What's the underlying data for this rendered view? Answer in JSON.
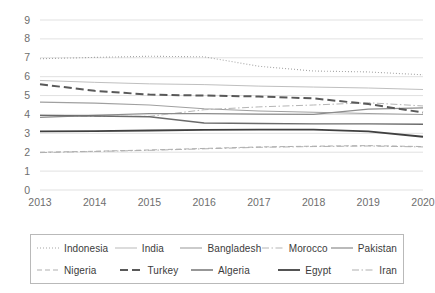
{
  "chart_data": {
    "type": "line",
    "title": "",
    "xlabel": "",
    "ylabel": "",
    "categories": [
      "2013",
      "2014",
      "2015",
      "2016",
      "2017",
      "2018",
      "2019",
      "2020"
    ],
    "x": [
      2013,
      2014,
      2015,
      2016,
      2017,
      2018,
      2019,
      2020
    ],
    "ylim": [
      0,
      9
    ],
    "yticks": [
      "0",
      "1",
      "2",
      "3",
      "4",
      "5",
      "6",
      "7",
      "8",
      "9"
    ],
    "grid": "horizontal",
    "legend_position": "bottom",
    "series": [
      {
        "name": "Indonesia",
        "style": "dotted",
        "color": "#a6a6a6",
        "width": 1.1,
        "values": [
          6.95,
          7.02,
          7.08,
          7.05,
          6.55,
          6.3,
          6.25,
          6.1
        ]
      },
      {
        "name": "India",
        "style": "solid",
        "color": "#bfbfbf",
        "width": 1.0,
        "values": [
          5.8,
          5.7,
          5.62,
          5.58,
          5.5,
          5.45,
          5.4,
          5.32
        ]
      },
      {
        "name": "Bangladesh",
        "style": "solid",
        "color": "#a0a0a0",
        "width": 1.1,
        "values": [
          4.65,
          4.6,
          4.5,
          4.3,
          4.18,
          4.12,
          4.05,
          4.0
        ]
      },
      {
        "name": "Morocco",
        "style": "dashdot",
        "color": "#b5b5b5",
        "width": 1.0,
        "values": [
          3.95,
          3.9,
          3.9,
          4.25,
          4.4,
          4.5,
          4.62,
          4.45
        ]
      },
      {
        "name": "Pakistan",
        "style": "solid",
        "color": "#8c8c8c",
        "width": 1.2,
        "values": [
          3.85,
          3.95,
          4.05,
          4.05,
          4.02,
          4.0,
          4.28,
          4.35
        ]
      },
      {
        "name": "Nigeria",
        "style": "dashed",
        "color": "#b0b0b0",
        "width": 1.0,
        "values": [
          2.0,
          2.05,
          2.12,
          2.2,
          2.28,
          2.32,
          2.35,
          2.3
        ]
      },
      {
        "name": "Turkey",
        "style": "longdash",
        "color": "#595959",
        "width": 2.0,
        "values": [
          5.6,
          5.25,
          5.05,
          5.0,
          4.95,
          4.85,
          4.55,
          4.1
        ]
      },
      {
        "name": "Algeria",
        "style": "solid",
        "color": "#6b6b6b",
        "width": 1.4,
        "values": [
          3.95,
          3.92,
          3.88,
          3.55,
          3.52,
          3.5,
          3.5,
          3.48
        ]
      },
      {
        "name": "Egypt",
        "style": "solid",
        "color": "#404040",
        "width": 1.8,
        "values": [
          3.1,
          3.12,
          3.15,
          3.18,
          3.2,
          3.2,
          3.1,
          2.82
        ]
      },
      {
        "name": "Iran",
        "style": "dashdot",
        "color": "#b0b0b0",
        "width": 1.0,
        "values": [
          1.98,
          2.04,
          2.1,
          2.18,
          2.26,
          2.3,
          2.33,
          2.28
        ]
      }
    ]
  },
  "legend": {
    "rows": [
      [
        "Indonesia",
        "India",
        "Bangladesh",
        "Morocco",
        "Pakistan"
      ],
      [
        "Nigeria",
        "Turkey",
        "Algeria",
        "Egypt",
        "Iran"
      ]
    ]
  }
}
